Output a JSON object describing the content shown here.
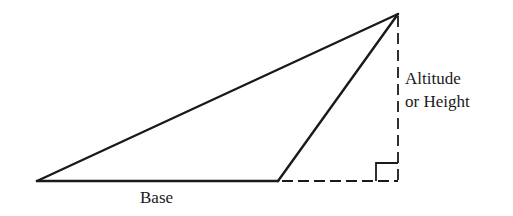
{
  "diagram": {
    "labels": {
      "altitude_line1": "Altitude",
      "altitude_line2": "or Height",
      "base": "Base"
    },
    "colors": {
      "stroke": "#1a1a1a",
      "background": "#ffffff"
    },
    "geometry": {
      "left_vertex": [
        37,
        181
      ],
      "top_vertex": [
        398,
        14
      ],
      "obtuse_vertex": [
        278,
        181
      ],
      "altitude_foot": [
        398,
        181
      ],
      "right_angle_marker_size": 22
    }
  }
}
